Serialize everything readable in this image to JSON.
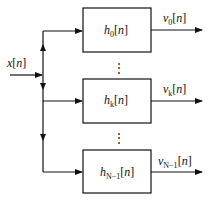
{
  "diagram": {
    "type": "filter-bank",
    "input": {
      "label": "x[n]",
      "var": "x",
      "arg": "n"
    },
    "filters": [
      {
        "name": "h",
        "sub": "0",
        "arg": "n",
        "output": {
          "name": "v",
          "sub": "0",
          "arg": "n"
        }
      },
      {
        "name": "h",
        "sub": "k",
        "arg": "n",
        "output": {
          "name": "v",
          "sub": "k",
          "arg": "n"
        }
      },
      {
        "name": "h",
        "sub": "N−1",
        "arg": "n",
        "output": {
          "name": "v",
          "sub": "N−1",
          "arg": "n"
        }
      }
    ],
    "ellipsis": "⋮",
    "colors": {
      "line": "#111111",
      "background": "#ffffff"
    }
  }
}
